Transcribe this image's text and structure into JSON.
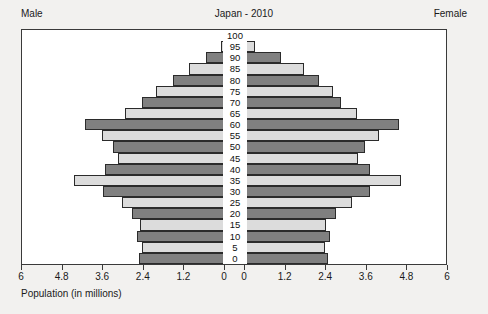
{
  "header": {
    "male_label": "Male",
    "female_label": "Female",
    "title": "Japan - 2010"
  },
  "axis": {
    "x_title": "Population (in millions)",
    "x_ticks_left": [
      "6",
      "4.8",
      "3.6",
      "2.4",
      "1.2",
      "0"
    ],
    "x_ticks_right": [
      "0",
      "1.2",
      "2.4",
      "3.6",
      "4.8",
      "6"
    ],
    "y_labels": [
      "100",
      "95",
      "90",
      "85",
      "80",
      "75",
      "70",
      "65",
      "60",
      "55",
      "50",
      "45",
      "40",
      "35",
      "30",
      "25",
      "20",
      "15",
      "10",
      "5",
      "0"
    ]
  },
  "colors": {
    "bar_dark": "#808080",
    "bar_light": "#dcdcdc",
    "bar_outline": "#2b2b2b",
    "plot_background": "#ffffff",
    "page_background": "#f2f1ef",
    "text": "#1a1a1a"
  },
  "chart_data": {
    "type": "bar",
    "title": "Japan - 2010",
    "subtitle": "",
    "xlabel": "Population (in millions)",
    "ylabel": "",
    "xlim": [
      0,
      6
    ],
    "ylim": [
      0,
      100
    ],
    "grid": false,
    "legend": [
      "Male",
      "Female"
    ],
    "legend_position": "top-left-and-top-right",
    "categories": [
      "100",
      "95",
      "90",
      "85",
      "80",
      "75",
      "70",
      "65",
      "60",
      "55",
      "50",
      "45",
      "40",
      "35",
      "30",
      "25",
      "20",
      "15",
      "10",
      "5",
      "0"
    ],
    "series": [
      {
        "name": "Male",
        "values": [
          0.01,
          0.13,
          0.55,
          1.05,
          1.55,
          2.05,
          2.45,
          2.95,
          4.15,
          3.65,
          3.3,
          3.15,
          3.55,
          4.45,
          3.6,
          3.05,
          2.75,
          2.5,
          2.6,
          2.45,
          2.55
        ]
      },
      {
        "name": "Female",
        "values": [
          0.03,
          0.3,
          1.05,
          1.75,
          2.2,
          2.6,
          2.85,
          3.3,
          4.55,
          3.95,
          3.55,
          3.35,
          3.7,
          4.6,
          3.7,
          3.15,
          2.7,
          2.4,
          2.5,
          2.35,
          2.45
        ]
      }
    ]
  }
}
